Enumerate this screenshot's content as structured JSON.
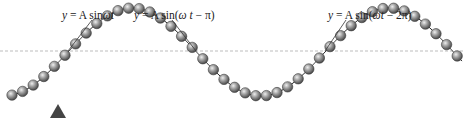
{
  "diagram": {
    "type": "transverse-wave-string-of-beads",
    "axis": {
      "y": 51,
      "style": "dashed",
      "color": "#bdbdbd"
    },
    "wave": {
      "center_y": 52,
      "amplitude": 44,
      "period_px": 257,
      "x_zero": 68,
      "phase_sign": -1,
      "bead_spacing_px": 10.6,
      "bead_start_x": 12,
      "bead_end_x": 462,
      "bead_radius": 5.2,
      "bead_color": "#8a8a8a",
      "bead_highlight": "#e6e6e6",
      "string_color": "#2a2a2a"
    },
    "labels": [
      {
        "id": "label-phase-0",
        "prefix": "y",
        "eq": " = A sin",
        "arg": "ωt",
        "suffix": "",
        "x": 62,
        "y": 10,
        "anchor": {
          "x": 68,
          "y": 51
        },
        "line_from": {
          "x": 92,
          "y": 20
        }
      },
      {
        "id": "label-phase-pi",
        "prefix": "y",
        "eq": " = A sin(",
        "arg": "ω t",
        "suffix": " − π)",
        "x": 134,
        "y": 10,
        "anchor": {
          "x": 196,
          "y": 51
        },
        "line_from": {
          "x": 172,
          "y": 20
        }
      },
      {
        "id": "label-phase-2pi",
        "prefix": "y",
        "eq": " = A sin(",
        "arg": "ωt",
        "suffix": " − 2π)",
        "x": 328,
        "y": 10,
        "anchor": {
          "x": 325,
          "y": 51
        },
        "line_from": {
          "x": 346,
          "y": 20
        }
      }
    ],
    "marker": {
      "name": "triangle-marker",
      "x": 50,
      "y": 104,
      "w": 16,
      "h": 14,
      "color": "#444444"
    }
  }
}
